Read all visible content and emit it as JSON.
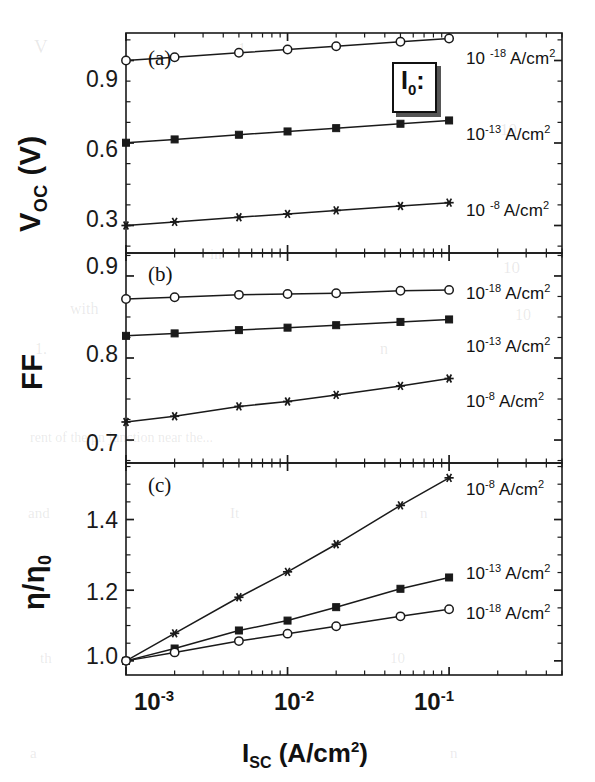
{
  "figure": {
    "background_color": "#ffffff",
    "line_color": "#1a1a1a",
    "xlabel": "I_SC (A/cm²)",
    "xlabel_parts": {
      "base": "I",
      "sub": "SC",
      "rest": "(A/cm",
      "sup": "2",
      "close": ")"
    },
    "x_tick_labels": [
      "10⁻³",
      "10⁻²",
      "10⁻¹"
    ],
    "x_tick_bases": [
      "10",
      "10",
      "10"
    ],
    "x_tick_exponents": [
      "-3",
      "-2",
      "-1"
    ],
    "legend_box_label": "I",
    "legend_box_sub": "0",
    "legend_box_colon": ":",
    "panels": [
      {
        "tag": "(a)",
        "ylabel": "V_OC (V)",
        "ylabel_base": "V",
        "ylabel_sub": "OC",
        "ylabel_rest": "(V)",
        "y_tick_labels": [
          "0.9",
          "0.6",
          "0.3"
        ],
        "series_labels": [
          "10 -18 A/cm²",
          "10-13 A/cm²",
          "10 -8 A/cm²"
        ]
      },
      {
        "tag": "(b)",
        "ylabel": "FF",
        "y_tick_labels": [
          "0.9",
          "0.8",
          "0.7"
        ],
        "series_labels": [
          "10-18 A/cm²",
          "10-13 A/cm²",
          "10-8 A/cm²"
        ]
      },
      {
        "tag": "(c)",
        "ylabel": "η/η₀",
        "ylabel_base": "η/η",
        "ylabel_sub": "0",
        "y_tick_labels": [
          "1.4",
          "1.2",
          "1.0"
        ],
        "series_labels": [
          "10-8 A/cm²",
          "10-13 A/cm²",
          "10-18 A/cm²"
        ]
      }
    ]
  },
  "chart_data": [
    {
      "type": "line",
      "panel": "(a)",
      "title": "",
      "xlabel": "I_SC (A/cm²)",
      "ylabel": "V_OC (V)",
      "xscale": "log",
      "xlim": [
        0.001,
        0.5
      ],
      "ylim": [
        0.2,
        1.0
      ],
      "yticks": [
        0.3,
        0.6,
        0.9
      ],
      "xticks": [
        0.001,
        0.01,
        0.1
      ],
      "grid": false,
      "legend_position": "right-of-axes",
      "x": [
        0.001,
        0.002,
        0.005,
        0.01,
        0.02,
        0.05,
        0.1
      ],
      "series": [
        {
          "name": "10^-18 A/cm²",
          "marker": "open-circle",
          "values": [
            0.9,
            0.912,
            0.928,
            0.94,
            0.952,
            0.968,
            0.98
          ]
        },
        {
          "name": "10^-13 A/cm²",
          "marker": "filled-square",
          "values": [
            0.601,
            0.613,
            0.63,
            0.642,
            0.654,
            0.67,
            0.682
          ]
        },
        {
          "name": "10^-8 A/cm²",
          "marker": "star",
          "values": [
            0.3,
            0.313,
            0.33,
            0.342,
            0.355,
            0.371,
            0.383
          ]
        }
      ]
    },
    {
      "type": "line",
      "panel": "(b)",
      "title": "",
      "xlabel": "I_SC (A/cm²)",
      "ylabel": "FF",
      "xscale": "log",
      "xlim": [
        0.001,
        0.5
      ],
      "ylim": [
        0.672,
        0.928
      ],
      "yticks": [
        0.7,
        0.8,
        0.9
      ],
      "xticks": [
        0.001,
        0.01,
        0.1
      ],
      "grid": false,
      "legend_position": "right-of-axes",
      "x": [
        0.001,
        0.002,
        0.005,
        0.01,
        0.02,
        0.05,
        0.1
      ],
      "series": [
        {
          "name": "10^-18 A/cm²",
          "marker": "open-circle",
          "values": [
            0.872,
            0.874,
            0.877,
            0.878,
            0.879,
            0.882,
            0.883
          ]
        },
        {
          "name": "10^-13 A/cm²",
          "marker": "filled-square",
          "values": [
            0.827,
            0.83,
            0.834,
            0.837,
            0.84,
            0.844,
            0.847
          ]
        },
        {
          "name": "10^-8 A/cm²",
          "marker": "star",
          "values": [
            0.722,
            0.729,
            0.741,
            0.747,
            0.755,
            0.766,
            0.775
          ]
        }
      ]
    },
    {
      "type": "line",
      "panel": "(c)",
      "title": "",
      "xlabel": "I_SC (A/cm²)",
      "ylabel": "η/η₀",
      "xscale": "log",
      "xlim": [
        0.001,
        0.5
      ],
      "ylim": [
        0.96,
        1.56
      ],
      "yticks": [
        1.0,
        1.2,
        1.4
      ],
      "xticks": [
        0.001,
        0.01,
        0.1
      ],
      "grid": false,
      "legend_position": "right-of-axes",
      "x": [
        0.001,
        0.002,
        0.005,
        0.01,
        0.02,
        0.05,
        0.1
      ],
      "series": [
        {
          "name": "10^-8 A/cm²",
          "marker": "star",
          "values": [
            1.0,
            1.078,
            1.18,
            1.252,
            1.33,
            1.44,
            1.518
          ]
        },
        {
          "name": "10^-13 A/cm²",
          "marker": "filled-square",
          "values": [
            1.0,
            1.035,
            1.086,
            1.114,
            1.152,
            1.204,
            1.236
          ]
        },
        {
          "name": "10^-18 A/cm²",
          "marker": "open-circle",
          "values": [
            1.0,
            1.024,
            1.056,
            1.077,
            1.098,
            1.126,
            1.146
          ]
        }
      ]
    }
  ],
  "background_text": [
    {
      "text": "V",
      "x": 34,
      "y": 36,
      "size": 19
    },
    {
      "text": "1",
      "x": 238,
      "y": 40,
      "size": 16
    },
    {
      "text": "10",
      "x": 500,
      "y": 120,
      "size": 17
    },
    {
      "text": "in",
      "x": 210,
      "y": 246,
      "size": 15
    },
    {
      "text": "10",
      "x": 503,
      "y": 258,
      "size": 17
    },
    {
      "text": "with",
      "x": 70,
      "y": 300,
      "size": 16
    },
    {
      "text": "10",
      "x": 515,
      "y": 306,
      "size": 16
    },
    {
      "text": "1.",
      "x": 35,
      "y": 340,
      "size": 16
    },
    {
      "text": "n",
      "x": 380,
      "y": 340,
      "size": 16
    },
    {
      "text": "rent of the pn junction near the...",
      "x": 30,
      "y": 430,
      "size": 14
    },
    {
      "text": "and",
      "x": 28,
      "y": 505,
      "size": 15
    },
    {
      "text": "It",
      "x": 230,
      "y": 505,
      "size": 15
    },
    {
      "text": "n",
      "x": 420,
      "y": 505,
      "size": 15
    },
    {
      "text": "th",
      "x": 40,
      "y": 650,
      "size": 15
    },
    {
      "text": "10",
      "x": 390,
      "y": 650,
      "size": 15
    },
    {
      "text": "a",
      "x": 30,
      "y": 745,
      "size": 15
    },
    {
      "text": "n",
      "x": 450,
      "y": 745,
      "size": 15
    }
  ]
}
